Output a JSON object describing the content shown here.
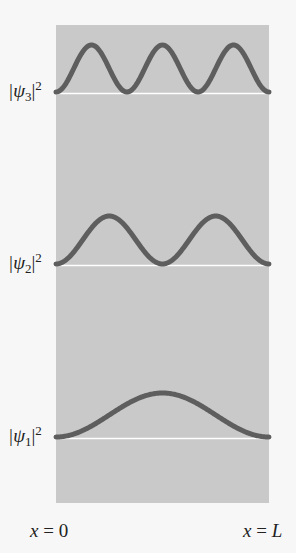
{
  "colors": {
    "panel": "#c9c9c9",
    "curve": "#5e5e5e",
    "baseline": "#ffffff",
    "background": "#f7f7f7"
  },
  "labels": {
    "psi3": {
      "base": "|ψ",
      "sub": "3",
      "close": "|",
      "sup": "2"
    },
    "psi2": {
      "base": "|ψ",
      "sub": "2",
      "close": "|",
      "sup": "2"
    },
    "psi1": {
      "base": "|ψ",
      "sub": "1",
      "close": "|",
      "sup": "2"
    }
  },
  "axis": {
    "left": {
      "var": "x",
      "eq": " = ",
      "val": "0"
    },
    "right": {
      "var": "x",
      "eq": " = ",
      "val": "L"
    }
  },
  "curves": [
    {
      "name": "psi3",
      "n": 3,
      "baseline_y": 92,
      "amplitude": 47
    },
    {
      "name": "psi2",
      "n": 2,
      "baseline_y": 264,
      "amplitude": 48
    },
    {
      "name": "psi1",
      "n": 1,
      "baseline_y": 437,
      "amplitude": 44
    }
  ]
}
